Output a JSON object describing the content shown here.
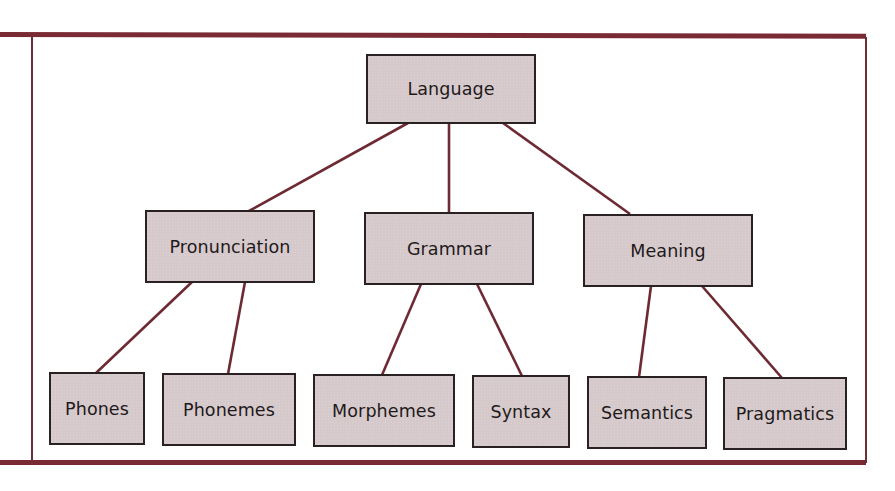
{
  "diagram": {
    "type": "tree",
    "colors": {
      "box_fill": "#d6c9cc",
      "box_border": "#2a2222",
      "connector": "#6e2a33",
      "frame": "#7a2a33"
    },
    "root": {
      "label": "Language"
    },
    "level1": [
      {
        "label": "Pronunciation"
      },
      {
        "label": "Grammar"
      },
      {
        "label": "Meaning"
      }
    ],
    "level2": [
      {
        "label": "Phones",
        "parent": "Pronunciation"
      },
      {
        "label": "Phonemes",
        "parent": "Pronunciation"
      },
      {
        "label": "Morphemes",
        "parent": "Grammar"
      },
      {
        "label": "Syntax",
        "parent": "Grammar"
      },
      {
        "label": "Semantics",
        "parent": "Meaning"
      },
      {
        "label": "Pragmatics",
        "parent": "Meaning"
      }
    ]
  }
}
